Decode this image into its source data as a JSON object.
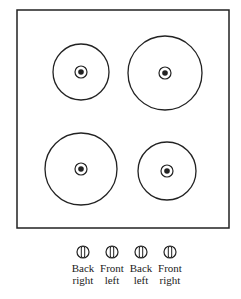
{
  "diagram": {
    "type": "stovetop",
    "burners": [
      {
        "name": "back-left",
        "cx": 81,
        "cy": 72,
        "r": 28
      },
      {
        "name": "back-right",
        "cx": 165,
        "cy": 73,
        "r": 37
      },
      {
        "name": "front-left",
        "cx": 81,
        "cy": 169,
        "r": 36
      },
      {
        "name": "front-right",
        "cx": 167,
        "cy": 171,
        "r": 29
      }
    ],
    "knobs": [
      {
        "line1": "Back",
        "line2": "right",
        "x": 83
      },
      {
        "line1": "Front",
        "line2": "left",
        "x": 112
      },
      {
        "line1": "Back",
        "line2": "left",
        "x": 141
      },
      {
        "line1": "Front",
        "line2": "right",
        "x": 170
      }
    ]
  }
}
